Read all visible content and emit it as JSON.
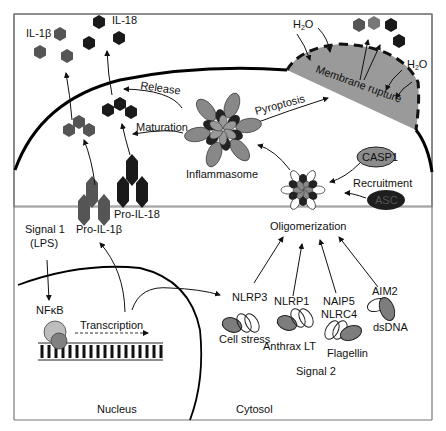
{
  "diagram": {
    "colors": {
      "il1b": "#555555",
      "il18": "#1a1a1a",
      "membrane_rupture": "#9a9a9a",
      "asc": "#1e1e1e",
      "casp1": "#8c8c8c",
      "sensor_gray": "#7d7d7d",
      "nfkb_light": "#bdbdbd",
      "nfkb_dark": "#808080"
    },
    "labels": {
      "il1b": "IL-1β",
      "il18": "IL-18",
      "h2o_top": "H2O",
      "h2o_right": "H2O",
      "membrane_rupture": "Membrane rupture",
      "release": "Release",
      "maturation": "Maturation",
      "pyroptosis": "Pyroptosis",
      "inflammasome": "Inflammasome",
      "casp1": "CASP1",
      "recruitment": "Recruitment",
      "asc": "ASC",
      "oligomerization": "Oligomerization",
      "pro_il18": "Pro-IL-18",
      "pro_il1b": "Pro-IL-1β",
      "signal1": "Signal 1",
      "lps": "(LPS)",
      "nfkb": "NFκB",
      "transcription": "Transcription",
      "nucleus": "Nucleus",
      "cytosol": "Cytosol",
      "signal2": "Signal 2"
    },
    "sensors": [
      {
        "name": "NLRP3",
        "ligand": "Cell stress"
      },
      {
        "name": "NLRP1",
        "ligand": "Anthrax LT"
      },
      {
        "name": "NAIP5",
        "name2": "NLRC4",
        "ligand": "Flagellin"
      },
      {
        "name": "AIM2",
        "ligand": "dsDNA"
      }
    ]
  }
}
